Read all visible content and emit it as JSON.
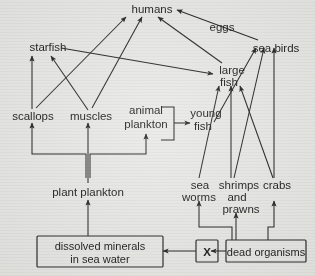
{
  "diagram": {
    "type": "food-web-diagram",
    "background_color": "#e9e9e6",
    "line_color": "#242424",
    "text_color": "#1b1b1b",
    "nodes": {
      "humans": "humans",
      "eggs": "eggs",
      "starfish": "starfish",
      "sea_birds": "sea birds",
      "large_fish_line1": "large",
      "large_fish_line2": "fish",
      "scallops": "scallops",
      "muscles": "muscles",
      "animal_plankton_line1": "animal",
      "animal_plankton_line2": "plankton",
      "young_fish_line1": "young",
      "young_fish_line2": "fish",
      "sea_worms_line1": "sea",
      "sea_worms_line2": "worms",
      "shrimps_line1": "shrimps",
      "shrimps_line2": "and",
      "shrimps_line3": "prawns",
      "crabs": "crabs",
      "plant_plankton": "plant plankton",
      "dissolved_minerals_line1": "dissolved minerals",
      "dissolved_minerals_line2": "in sea water",
      "unknown_box": "X",
      "dead_organisms": "dead organisms"
    },
    "edges": [
      {
        "from": "scallops",
        "to": "starfish"
      },
      {
        "from": "muscles",
        "to": "starfish"
      },
      {
        "from": "scallops",
        "to": "humans"
      },
      {
        "from": "muscles",
        "to": "humans"
      },
      {
        "from": "large fish",
        "to": "humans"
      },
      {
        "from": "sea birds",
        "to": "humans",
        "label": "eggs"
      },
      {
        "from": "starfish",
        "to": "large fish"
      },
      {
        "from": "plant plankton",
        "to": "scallops"
      },
      {
        "from": "plant plankton",
        "to": "muscles"
      },
      {
        "from": "plant plankton",
        "to": "animal plankton"
      },
      {
        "from": "animal plankton",
        "to": "young fish"
      },
      {
        "from": "young fish",
        "to": "sea birds"
      },
      {
        "from": "young fish",
        "to": "large fish"
      },
      {
        "from": "sea worms",
        "to": "large fish"
      },
      {
        "from": "shrimps and prawns",
        "to": "large fish"
      },
      {
        "from": "shrimps and prawns",
        "to": "sea birds"
      },
      {
        "from": "crabs",
        "to": "sea birds"
      },
      {
        "from": "crabs",
        "to": "large fish"
      },
      {
        "from": "dissolved minerals in sea water",
        "to": "plant plankton"
      },
      {
        "from": "X",
        "to": "dissolved minerals in sea water"
      },
      {
        "from": "dead organisms",
        "to": "X"
      },
      {
        "from": "dead organisms",
        "to": "sea worms"
      },
      {
        "from": "dead organisms",
        "to": "shrimps and prawns"
      },
      {
        "from": "dead organisms",
        "to": "crabs"
      }
    ]
  }
}
